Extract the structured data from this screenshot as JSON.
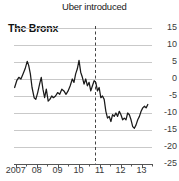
{
  "chart_data": {
    "type": "line",
    "title": "The Bronx",
    "annotation": "Uber introduced",
    "annotation_x": 2010.8,
    "xlabel": "",
    "ylabel": "",
    "xlim": [
      2006.92,
      2013.5
    ],
    "ylim": [
      -25,
      15
    ],
    "grid": true,
    "legend": false,
    "ytick_labels": [
      "15",
      "10",
      "5",
      "0",
      "-5",
      "-10",
      "-15",
      "-20",
      "-25"
    ],
    "ytick_values": [
      15,
      10,
      5,
      0,
      -5,
      -10,
      -15,
      -20,
      -25
    ],
    "xtick_labels": [
      "2007",
      "08",
      "09",
      "10",
      "11",
      "12",
      "13"
    ],
    "xtick_values": [
      2007,
      2008,
      2009,
      2010,
      2011,
      2012,
      2013
    ],
    "series": [
      {
        "name": "The Bronx",
        "color": "#1a1a1a",
        "x": [
          2006.95,
          2007.05,
          2007.15,
          2007.25,
          2007.35,
          2007.45,
          2007.55,
          2007.62,
          2007.7,
          2007.78,
          2007.88,
          2007.96,
          2008.05,
          2008.14,
          2008.22,
          2008.3,
          2008.38,
          2008.46,
          2008.55,
          2008.63,
          2008.72,
          2008.8,
          2008.9,
          2009.0,
          2009.1,
          2009.2,
          2009.3,
          2009.4,
          2009.5,
          2009.6,
          2009.7,
          2009.78,
          2009.86,
          2009.94,
          2010.02,
          2010.1,
          2010.18,
          2010.26,
          2010.34,
          2010.42,
          2010.5,
          2010.58,
          2010.66,
          2010.74,
          2010.82,
          2010.9,
          2010.98,
          2011.06,
          2011.14,
          2011.22,
          2011.3,
          2011.38,
          2011.46,
          2011.54,
          2011.62,
          2011.7,
          2011.78,
          2011.86,
          2011.94,
          2012.02,
          2012.1,
          2012.18,
          2012.26,
          2012.34,
          2012.42,
          2012.5,
          2012.58,
          2012.66,
          2012.74,
          2012.82,
          2012.9,
          2012.98,
          2013.06,
          2013.14,
          2013.22,
          2013.3
        ],
        "y": [
          -2.5,
          -0.5,
          0.5,
          0.0,
          1.5,
          3.0,
          5.2,
          4.0,
          1.5,
          -2.5,
          -5.5,
          -6.0,
          -4.0,
          -1.5,
          0.5,
          -3.0,
          -5.5,
          -3.0,
          -6.5,
          -6.0,
          -5.0,
          -5.5,
          -5.0,
          -4.0,
          -4.5,
          -3.0,
          -3.5,
          -4.5,
          -3.5,
          -2.0,
          0.0,
          -1.0,
          1.5,
          3.0,
          5.5,
          2.0,
          0.5,
          -1.5,
          0.0,
          -2.0,
          -1.0,
          -3.5,
          -2.0,
          -0.5,
          -1.0,
          -3.5,
          -2.5,
          -5.5,
          -5.0,
          -6.0,
          -9.5,
          -11.5,
          -11.0,
          -12.5,
          -10.5,
          -11.0,
          -10.0,
          -11.0,
          -9.5,
          -10.5,
          -12.0,
          -11.5,
          -12.0,
          -10.0,
          -10.5,
          -12.0,
          -14.0,
          -14.5,
          -13.5,
          -12.0,
          -11.0,
          -9.5,
          -8.5,
          -8.0,
          -8.5,
          -7.5
        ]
      }
    ]
  },
  "axis": {
    "baseline_color": "#555555",
    "grid_color": "#c9c9c9",
    "annotation_line_color": "#444444"
  }
}
